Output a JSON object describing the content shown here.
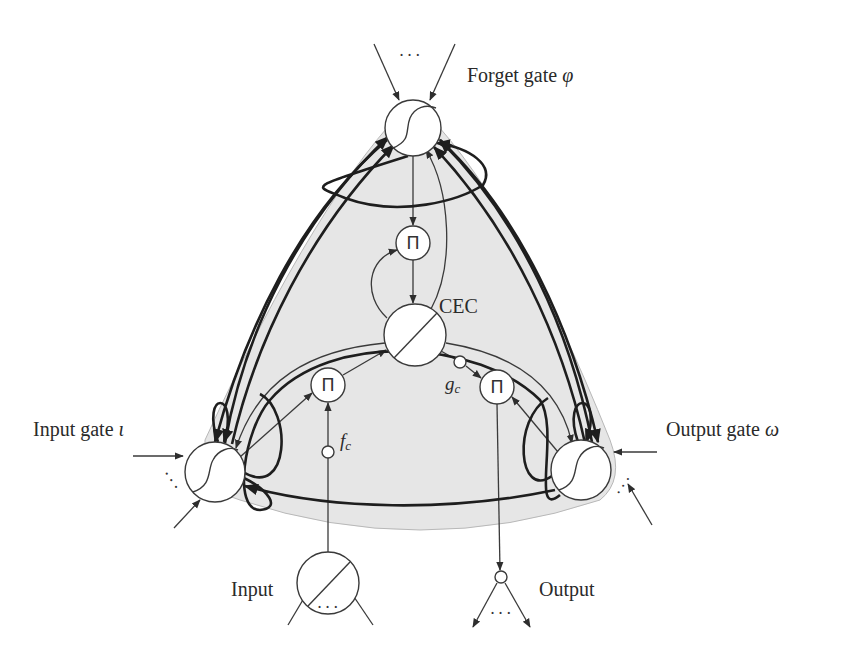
{
  "figure": {
    "labels": {
      "forget_gate": "Forget gate",
      "forget_gate_symbol": "φ",
      "input_gate": "Input gate",
      "input_gate_symbol": "ι",
      "output_gate": "Output gate",
      "output_gate_symbol": "ω",
      "cec": "CEC",
      "input": "Input",
      "output": "Output",
      "f_c": "f",
      "f_c_sub": "c",
      "g_c": "g",
      "g_c_sub": "c",
      "pi_symbol": "Π",
      "ellipsis": "···"
    },
    "colors": {
      "background": "#ffffff",
      "region_fill": "#e6e6e6",
      "region_edge": "#b5b5b5",
      "stroke": "#3a3a3a",
      "node_fill": "#ffffff"
    },
    "nodes": [
      {
        "id": "forget_gate",
        "type": "sigmoid",
        "cx": 413,
        "cy": 128,
        "r": 28
      },
      {
        "id": "pi_forget",
        "type": "product",
        "cx": 413,
        "cy": 243,
        "r": 17
      },
      {
        "id": "cec",
        "type": "linear",
        "cx": 415,
        "cy": 335,
        "r": 31
      },
      {
        "id": "pi_input",
        "type": "product",
        "cx": 328,
        "cy": 385,
        "r": 17
      },
      {
        "id": "pi_output",
        "type": "product",
        "cx": 497,
        "cy": 387,
        "r": 17
      },
      {
        "id": "g_c",
        "type": "small",
        "cx": 460,
        "cy": 362,
        "r": 6
      },
      {
        "id": "f_c",
        "type": "small",
        "cx": 328,
        "cy": 452,
        "r": 6
      },
      {
        "id": "input_gate",
        "type": "sigmoid",
        "cx": 215,
        "cy": 472,
        "r": 30
      },
      {
        "id": "output_gate",
        "type": "sigmoid",
        "cx": 581,
        "cy": 470,
        "r": 30
      },
      {
        "id": "input_unit",
        "type": "linear",
        "cx": 328,
        "cy": 583,
        "r": 31
      },
      {
        "id": "output_unit",
        "type": "small",
        "cx": 501,
        "cy": 577,
        "r": 6
      }
    ]
  }
}
